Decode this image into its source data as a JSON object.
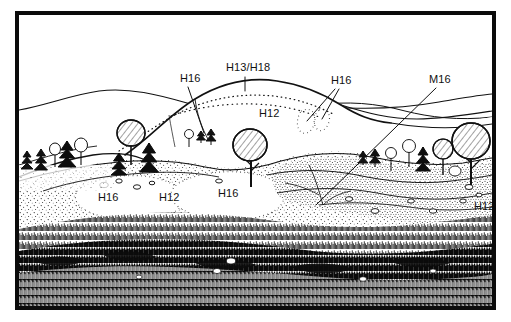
{
  "figure": {
    "kind": "landscape-profile-line-drawing",
    "medium": "pen-and-ink hatched illustration",
    "frame_color": "#0b0b0b",
    "ink_color": "#111111",
    "paper_color": "#ffffff"
  },
  "labels": [
    {
      "id": "h16-upper-left",
      "text": "H16",
      "x": 176,
      "y": 64,
      "leaders": 1
    },
    {
      "id": "h13-h18-summit",
      "text": "H13/H18",
      "x": 222,
      "y": 53,
      "leaders": 1
    },
    {
      "id": "h12-upper",
      "text": "H12",
      "x": 255,
      "y": 99,
      "leaders": 0
    },
    {
      "id": "h16-upper-right",
      "text": "H16",
      "x": 327,
      "y": 66,
      "leaders": 2
    },
    {
      "id": "m16-right",
      "text": "M16",
      "x": 425,
      "y": 65,
      "leaders": 1
    },
    {
      "id": "h16-lower-left",
      "text": "H16",
      "x": 94,
      "y": 183,
      "leaders": 0
    },
    {
      "id": "h12-lower-left",
      "text": "H12",
      "x": 155,
      "y": 183,
      "leaders": 0
    },
    {
      "id": "h16-lower-mid",
      "text": "H16",
      "x": 214,
      "y": 179,
      "leaders": 0
    },
    {
      "id": "h12-lower-right",
      "text": "H12",
      "x": 473,
      "y": 192,
      "leaders": 0
    }
  ],
  "communities": [
    {
      "code": "H12",
      "occurrences": 3
    },
    {
      "code": "H13/H18",
      "occurrences": 1
    },
    {
      "code": "H16",
      "occurrences": 4
    },
    {
      "code": "M16",
      "occurrences": 1
    }
  ],
  "scene": {
    "background_ridges": 3,
    "foreground_texture": "dense vertical stroke heather sward",
    "mid_texture": "stippled grass/heath mosaic",
    "zone_boundaries": "dotted lines",
    "trees": {
      "total": 22,
      "conifers": 6,
      "deciduous": 9,
      "scrub_shrubs": 7
    },
    "boulders_visible": 14
  }
}
